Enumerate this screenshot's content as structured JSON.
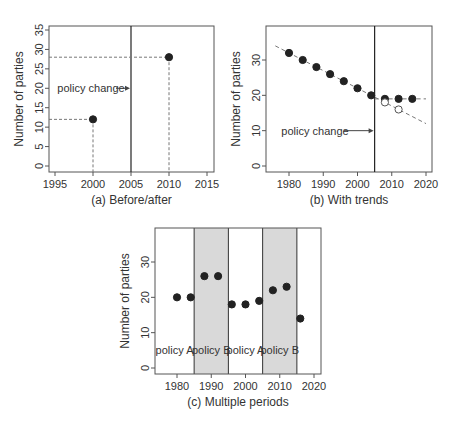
{
  "chart_data": [
    {
      "type": "scatter",
      "title": "(a) Before/after",
      "xlabel": "",
      "ylabel": "Number of parties",
      "xlim": [
        1994,
        2016
      ],
      "ylim": [
        -1,
        36
      ],
      "xticks": [
        1995,
        2000,
        2005,
        2010,
        2015
      ],
      "yticks": [
        0,
        5,
        10,
        15,
        20,
        25,
        30,
        35
      ],
      "points": [
        {
          "x": 2000,
          "y": 12
        },
        {
          "x": 2010,
          "y": 28
        }
      ],
      "vline": 2005,
      "annotation": {
        "text": "policy change",
        "y": 20
      }
    },
    {
      "type": "scatter",
      "title": "(b) With trends",
      "xlabel": "",
      "ylabel": "Number of parties",
      "xlim": [
        1973,
        2022
      ],
      "ylim": [
        -1,
        38
      ],
      "xticks": [
        1980,
        1990,
        2000,
        2010,
        2020
      ],
      "yticks": [
        0,
        10,
        20,
        30
      ],
      "series": [
        {
          "name": "observed",
          "marker": "filled",
          "x": [
            1980,
            1984,
            1988,
            1992,
            1996,
            2000,
            2004,
            2008,
            2012,
            2016
          ],
          "y": [
            32,
            30,
            28,
            26,
            24,
            22,
            20,
            19,
            19,
            19
          ]
        },
        {
          "name": "counterfactual",
          "marker": "open",
          "x": [
            2008,
            2012
          ],
          "y": [
            18,
            16
          ]
        }
      ],
      "trend_lines": [
        {
          "from": [
            1976,
            34
          ],
          "to": [
            2020,
            12
          ]
        },
        {
          "from": [
            2005,
            19
          ],
          "to": [
            2020,
            19
          ]
        }
      ],
      "vline": 2005,
      "annotation": {
        "text": "policy change",
        "y": 10
      }
    },
    {
      "type": "scatter",
      "title": "(c) Multiple periods",
      "xlabel": "",
      "ylabel": "Number of parties",
      "xlim": [
        1973,
        2022
      ],
      "ylim": [
        -1,
        38
      ],
      "xticks": [
        1980,
        1990,
        2000,
        2010,
        2020
      ],
      "yticks": [
        0,
        10,
        20,
        30
      ],
      "points": [
        {
          "x": 1980,
          "y": 20
        },
        {
          "x": 1984,
          "y": 20
        },
        {
          "x": 1988,
          "y": 26
        },
        {
          "x": 1992,
          "y": 26
        },
        {
          "x": 1996,
          "y": 18
        },
        {
          "x": 2000,
          "y": 18
        },
        {
          "x": 2004,
          "y": 19
        },
        {
          "x": 2008,
          "y": 22
        },
        {
          "x": 2012,
          "y": 23
        },
        {
          "x": 2016,
          "y": 14
        }
      ],
      "periods": [
        {
          "label": "policy A",
          "from": 1973,
          "to": 1985,
          "shaded": false
        },
        {
          "label": "policy B",
          "from": 1985,
          "to": 1995,
          "shaded": true
        },
        {
          "label": "policy A",
          "from": 1995,
          "to": 2005,
          "shaded": false
        },
        {
          "label": "policy B",
          "from": 2005,
          "to": 2015,
          "shaded": true
        }
      ]
    }
  ],
  "colors": {
    "point": "#222222",
    "shade": "#d9d9d9",
    "axis": "#555555",
    "dashed": "#777777"
  }
}
